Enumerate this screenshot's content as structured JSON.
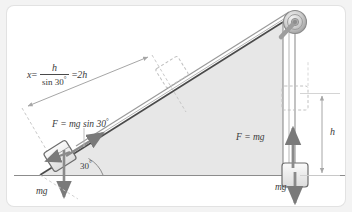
{
  "figure": {
    "background_color": "#f3f3f3",
    "panel_color": "#ffffff",
    "incline_fill": "#e6e6e6",
    "line_color": "#6f6f6f",
    "dark_line_color": "#3c3c3c",
    "arrow_color": "#8a8a8a",
    "text_color": "#3a3a3a"
  },
  "labels": {
    "x_equation": {
      "lhs": "x",
      "eq": "=",
      "numerator": "h",
      "denominator": "sin 30",
      "denominator_degree": "°",
      "result_eq": "=",
      "result": "2h"
    },
    "force_incline": "F = mg sin 30",
    "force_incline_degree": "°",
    "angle": "30",
    "angle_degree": "°",
    "weight_left": "mg",
    "force_hanging": "F = mg",
    "weight_right": "mg",
    "height": "h"
  },
  "geometry": {
    "incline_angle_deg": 30,
    "ground_y": 175,
    "apex": {
      "x": 283,
      "y": 22
    },
    "base_left": {
      "x": 40,
      "y": 175
    },
    "pulley": {
      "x": 295,
      "y": 22,
      "radius": 11
    },
    "rope_x": 295,
    "hanging_block": {
      "x": 295,
      "y": 163,
      "width": 26,
      "height": 24
    },
    "ghost_block_rope": {
      "x": 295,
      "y": 86,
      "width": 26,
      "height": 24
    },
    "ghost_block_incline": {
      "x": 172,
      "y": 68,
      "width": 26,
      "height": 22
    },
    "incline_block": {
      "x": 59,
      "y": 152
    },
    "height_dimension": {
      "x": 322,
      "y_top": 93,
      "y_bottom": 175
    },
    "x_dimension": {
      "x1": 22,
      "y1": 108,
      "x2": 152,
      "y2": 55
    }
  }
}
